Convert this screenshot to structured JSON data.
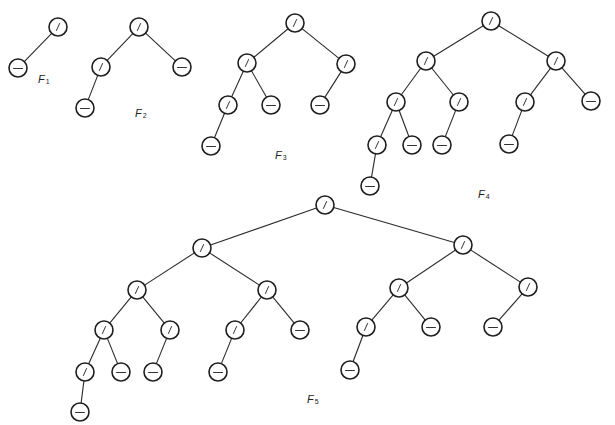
{
  "figure": {
    "node_radius": 9,
    "colors": {
      "background": "#ffffff",
      "stroke": "#1e1e1e",
      "edge": "#2a2a2a"
    },
    "node_types": {
      "internal": "slash",
      "leaf": "dash"
    }
  },
  "trees": [
    {
      "id": "F1",
      "label": {
        "main": "F",
        "sub": "1",
        "x": 38,
        "y": 74
      },
      "nodes": [
        {
          "id": "r",
          "x": 58,
          "y": 27,
          "type": "internal"
        },
        {
          "id": "l",
          "x": 18,
          "y": 68,
          "type": "leaf"
        }
      ],
      "edges": [
        [
          "r",
          "l"
        ]
      ]
    },
    {
      "id": "F2",
      "label": {
        "main": "F",
        "sub": "2",
        "x": 135,
        "y": 108
      },
      "nodes": [
        {
          "id": "r",
          "x": 139,
          "y": 27,
          "type": "internal"
        },
        {
          "id": "L",
          "x": 101,
          "y": 67,
          "type": "internal"
        },
        {
          "id": "R",
          "x": 182,
          "y": 67,
          "type": "leaf"
        },
        {
          "id": "LL",
          "x": 85,
          "y": 108,
          "type": "leaf"
        }
      ],
      "edges": [
        [
          "r",
          "L"
        ],
        [
          "r",
          "R"
        ],
        [
          "L",
          "LL"
        ]
      ]
    },
    {
      "id": "F3",
      "label": {
        "main": "F",
        "sub": "3",
        "x": 275,
        "y": 150
      },
      "nodes": [
        {
          "id": "r",
          "x": 295,
          "y": 23,
          "type": "internal"
        },
        {
          "id": "L",
          "x": 247,
          "y": 63,
          "type": "internal"
        },
        {
          "id": "R",
          "x": 346,
          "y": 64,
          "type": "internal"
        },
        {
          "id": "LL",
          "x": 228,
          "y": 105,
          "type": "internal"
        },
        {
          "id": "LR",
          "x": 271,
          "y": 105,
          "type": "leaf"
        },
        {
          "id": "RL",
          "x": 320,
          "y": 105,
          "type": "leaf"
        },
        {
          "id": "LLL",
          "x": 211,
          "y": 146,
          "type": "leaf"
        }
      ],
      "edges": [
        [
          "r",
          "L"
        ],
        [
          "r",
          "R"
        ],
        [
          "L",
          "LL"
        ],
        [
          "L",
          "LR"
        ],
        [
          "R",
          "RL"
        ],
        [
          "LL",
          "LLL"
        ]
      ]
    },
    {
      "id": "F4",
      "label": {
        "main": "F",
        "sub": "4",
        "x": 478,
        "y": 189
      },
      "nodes": [
        {
          "id": "r",
          "x": 491,
          "y": 21,
          "type": "internal"
        },
        {
          "id": "L",
          "x": 426,
          "y": 61,
          "type": "internal"
        },
        {
          "id": "R",
          "x": 556,
          "y": 61,
          "type": "internal"
        },
        {
          "id": "LL",
          "x": 396,
          "y": 102,
          "type": "internal"
        },
        {
          "id": "LR",
          "x": 459,
          "y": 102,
          "type": "internal"
        },
        {
          "id": "RL",
          "x": 525,
          "y": 102,
          "type": "internal"
        },
        {
          "id": "RR",
          "x": 591,
          "y": 101,
          "type": "leaf"
        },
        {
          "id": "LLL",
          "x": 377,
          "y": 145,
          "type": "internal"
        },
        {
          "id": "LLR",
          "x": 412,
          "y": 145,
          "type": "leaf"
        },
        {
          "id": "LRL",
          "x": 442,
          "y": 145,
          "type": "leaf"
        },
        {
          "id": "RLL",
          "x": 509,
          "y": 144,
          "type": "leaf"
        },
        {
          "id": "LLLL",
          "x": 370,
          "y": 186,
          "type": "leaf"
        }
      ],
      "edges": [
        [
          "r",
          "L"
        ],
        [
          "r",
          "R"
        ],
        [
          "L",
          "LL"
        ],
        [
          "L",
          "LR"
        ],
        [
          "R",
          "RL"
        ],
        [
          "R",
          "RR"
        ],
        [
          "LL",
          "LLL"
        ],
        [
          "LL",
          "LLR"
        ],
        [
          "LR",
          "LRL"
        ],
        [
          "RL",
          "RLL"
        ],
        [
          "LLL",
          "LLLL"
        ]
      ]
    },
    {
      "id": "F5",
      "label": {
        "main": "F",
        "sub": "5",
        "x": 307,
        "y": 394
      },
      "nodes": [
        {
          "id": "r",
          "x": 325,
          "y": 205,
          "type": "internal"
        },
        {
          "id": "L",
          "x": 202,
          "y": 248,
          "type": "internal"
        },
        {
          "id": "R",
          "x": 463,
          "y": 245,
          "type": "internal"
        },
        {
          "id": "LL",
          "x": 137,
          "y": 290,
          "type": "internal"
        },
        {
          "id": "LR",
          "x": 267,
          "y": 290,
          "type": "internal"
        },
        {
          "id": "RL",
          "x": 399,
          "y": 288,
          "type": "internal"
        },
        {
          "id": "RR",
          "x": 528,
          "y": 287,
          "type": "internal"
        },
        {
          "id": "LLL",
          "x": 104,
          "y": 330,
          "type": "internal"
        },
        {
          "id": "LLR",
          "x": 170,
          "y": 330,
          "type": "internal"
        },
        {
          "id": "LRL",
          "x": 235,
          "y": 330,
          "type": "internal"
        },
        {
          "id": "LRR",
          "x": 300,
          "y": 330,
          "type": "leaf"
        },
        {
          "id": "RLL",
          "x": 366,
          "y": 327,
          "type": "internal"
        },
        {
          "id": "RLR",
          "x": 431,
          "y": 327,
          "type": "leaf"
        },
        {
          "id": "RRL",
          "x": 493,
          "y": 327,
          "type": "leaf"
        },
        {
          "id": "LLLL",
          "x": 85,
          "y": 372,
          "type": "internal"
        },
        {
          "id": "LLLR",
          "x": 121,
          "y": 372,
          "type": "leaf"
        },
        {
          "id": "LLRL",
          "x": 153,
          "y": 372,
          "type": "leaf"
        },
        {
          "id": "LRLL",
          "x": 218,
          "y": 372,
          "type": "leaf"
        },
        {
          "id": "RLLL",
          "x": 350,
          "y": 370,
          "type": "leaf"
        },
        {
          "id": "LLLLL",
          "x": 80,
          "y": 412,
          "type": "leaf"
        }
      ],
      "edges": [
        [
          "r",
          "L"
        ],
        [
          "r",
          "R"
        ],
        [
          "L",
          "LL"
        ],
        [
          "L",
          "LR"
        ],
        [
          "R",
          "RL"
        ],
        [
          "R",
          "RR"
        ],
        [
          "LL",
          "LLL"
        ],
        [
          "LL",
          "LLR"
        ],
        [
          "LR",
          "LRL"
        ],
        [
          "LR",
          "LRR"
        ],
        [
          "RL",
          "RLL"
        ],
        [
          "RL",
          "RLR"
        ],
        [
          "RR",
          "RRL"
        ],
        [
          "LLL",
          "LLLL"
        ],
        [
          "LLL",
          "LLLR"
        ],
        [
          "LLR",
          "LLRL"
        ],
        [
          "LRL",
          "LRLL"
        ],
        [
          "RLL",
          "RLLL"
        ],
        [
          "LLLL",
          "LLLLL"
        ]
      ]
    }
  ]
}
